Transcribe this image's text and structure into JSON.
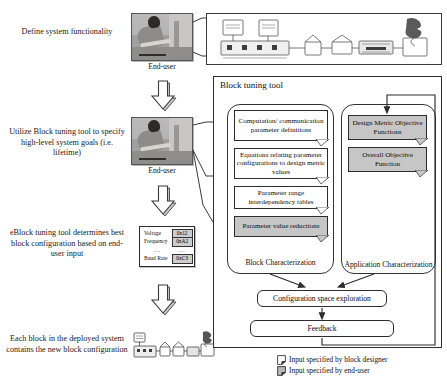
{
  "flow_steps": [
    {
      "id": "step-define",
      "label": "Define system functionality"
    },
    {
      "id": "step-utilize",
      "label": "Utilize Block tuning tool to specify high-level system goals (i.e. lifetime)"
    },
    {
      "id": "step-determine",
      "label": "eBlock tuning tool determines best block configuration based on end-user input"
    },
    {
      "id": "step-deploy",
      "label": "Each block in the deployed system contains the new block configuration"
    }
  ],
  "actors": {
    "end_user_caption": "End-user"
  },
  "config_table": {
    "rows": [
      {
        "key": "Voltage",
        "value": "0x12"
      },
      {
        "key": "Frequency",
        "value": "0xA2"
      },
      {
        "key": "...",
        "value": "..."
      },
      {
        "key": "Baud Rate",
        "value": "0xC3"
      }
    ]
  },
  "tool_panel": {
    "title": "Block tuning tool",
    "block_characterization": {
      "caption": "Block Characterization",
      "items": [
        {
          "label": "Computation/ communication parameter definitions",
          "fill": "white"
        },
        {
          "label": "Equations relating parameter configurations to design metric values",
          "fill": "white"
        },
        {
          "label": "Parameter range interdependency tables",
          "fill": "white"
        },
        {
          "label": "Parameter value reductions",
          "fill": "gray"
        }
      ]
    },
    "application_characterization": {
      "caption": "Application Characterization",
      "items": [
        {
          "label": "Design Metric Objective Functions",
          "fill": "gray"
        },
        {
          "label": "Overall Objective Function",
          "fill": "gray"
        }
      ]
    },
    "process": [
      {
        "label": "Configuration space exploration"
      },
      {
        "label": "Feedback"
      }
    ]
  },
  "legend": {
    "items": [
      {
        "label": "Input specified by block designer",
        "fill": "white"
      },
      {
        "label": "Input specified by end-user",
        "fill": "gray"
      }
    ]
  },
  "colors": {
    "note_white": "#ffffff",
    "note_gray": "#c6c6c6",
    "line": "#2d2d2d",
    "text": "#0d0d0d"
  }
}
